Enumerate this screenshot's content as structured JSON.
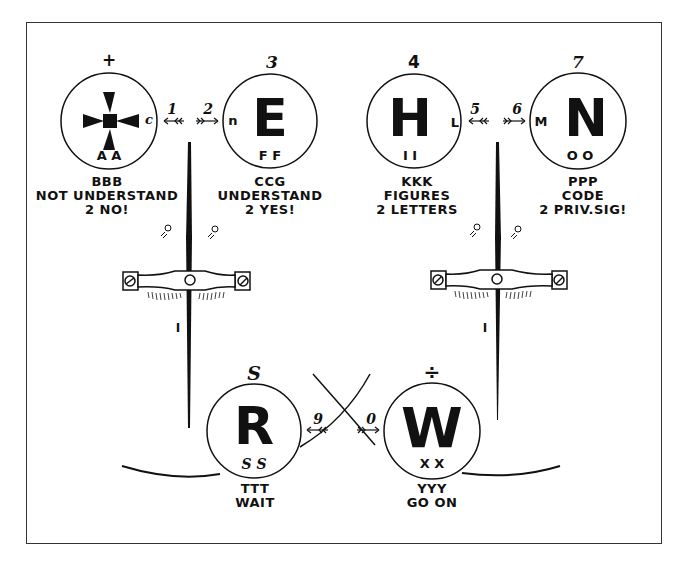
{
  "diagram": {
    "type": "semaphore signal key",
    "stroke_color": "#111111",
    "background": "#ffffff"
  },
  "circles": [
    {
      "id": "cross",
      "top_symbol": "+",
      "main_glyph": "cross-pattee",
      "side_letter": "c",
      "bottom_letters": "A A",
      "caption": [
        "BBB",
        "NOT UNDERSTAND",
        "2 NO!"
      ]
    },
    {
      "id": "E",
      "top_symbol": "3",
      "main_glyph": "E",
      "side_letter": "n",
      "bottom_letters": "F F",
      "caption": [
        "CCG",
        "UNDERSTAND",
        "2 YES!"
      ]
    },
    {
      "id": "H",
      "top_symbol": "4",
      "main_glyph": "H",
      "side_letter": "L",
      "bottom_letters": "I I",
      "caption": [
        "KKK",
        "FIGURES",
        "2 LETTERS"
      ]
    },
    {
      "id": "N",
      "top_symbol": "7",
      "main_glyph": "N",
      "side_letter": "M",
      "bottom_letters": "O O",
      "caption": [
        "PPP",
        "CODE",
        "2 PRIV.SIG!"
      ]
    },
    {
      "id": "R",
      "top_symbol": "S",
      "main_glyph": "R",
      "side_letter": "",
      "bottom_letters": "S S",
      "caption": [
        "TTT",
        "WAIT"
      ]
    },
    {
      "id": "W",
      "top_symbol": "÷",
      "main_glyph": "W",
      "side_letter": "",
      "bottom_letters": "X X",
      "caption": [
        "YYY",
        "GO ON"
      ]
    }
  ],
  "arrows": [
    {
      "label": "1",
      "direction": "left"
    },
    {
      "label": "2",
      "direction": "right"
    },
    {
      "label": "5",
      "direction": "left"
    },
    {
      "label": "6",
      "direction": "right"
    },
    {
      "label": "9",
      "direction": "left"
    },
    {
      "label": "0",
      "direction": "right"
    }
  ],
  "indicators": [
    {
      "id": "left-indicator",
      "pointer_label": "I"
    },
    {
      "id": "right-indicator",
      "pointer_label": "I"
    }
  ]
}
